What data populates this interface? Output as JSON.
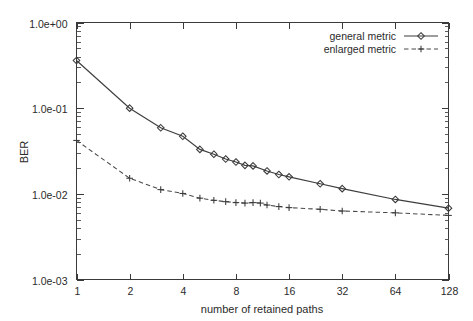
{
  "chart_data": {
    "type": "line",
    "title": "",
    "xlabel": "number of retained paths",
    "ylabel": "BER",
    "xscale": "log2",
    "yscale": "log10",
    "xlim": [
      1,
      128
    ],
    "ylim": [
      0.001,
      1.0
    ],
    "grid": false,
    "legend_position": "top-right",
    "x_tick_labels": [
      "1",
      "2",
      "4",
      "8",
      "16",
      "32",
      "64",
      "128"
    ],
    "x_tick_values": [
      1,
      2,
      4,
      8,
      16,
      32,
      64,
      128
    ],
    "y_tick_labels": [
      "1.0e+00",
      "1.0e-01",
      "1.0e-02",
      "1.0e-03"
    ],
    "y_tick_values": [
      1.0,
      0.1,
      0.01,
      0.001
    ],
    "series": [
      {
        "name": "general metric",
        "marker": "diamond",
        "linestyle": "solid",
        "color": "#3a3a3a",
        "x": [
          1,
          2,
          3,
          4,
          5,
          6,
          7,
          8,
          9,
          10,
          12,
          14,
          16,
          24,
          32,
          64,
          128
        ],
        "values": [
          0.36,
          0.1,
          0.059,
          0.047,
          0.033,
          0.029,
          0.0255,
          0.0235,
          0.0215,
          0.0212,
          0.0185,
          0.0168,
          0.0158,
          0.0131,
          0.0115,
          0.0086,
          0.0068
        ]
      },
      {
        "name": "enlarged metric",
        "marker": "plus",
        "linestyle": "dashed",
        "color": "#4a4a4a",
        "x": [
          1,
          2,
          3,
          4,
          5,
          6,
          7,
          8,
          9,
          10,
          11,
          12,
          14,
          16,
          24,
          32,
          64,
          128
        ],
        "values": [
          0.042,
          0.0152,
          0.0112,
          0.0101,
          0.0089,
          0.0084,
          0.0081,
          0.0079,
          0.0078,
          0.0079,
          0.0078,
          0.0074,
          0.0071,
          0.0069,
          0.0066,
          0.0063,
          0.006,
          0.0056
        ]
      }
    ]
  },
  "axes": {
    "y_title": "BER",
    "x_title": "number of retained paths"
  },
  "legend": {
    "entries": [
      {
        "label": "general metric"
      },
      {
        "label": "enlarged metric"
      }
    ]
  }
}
